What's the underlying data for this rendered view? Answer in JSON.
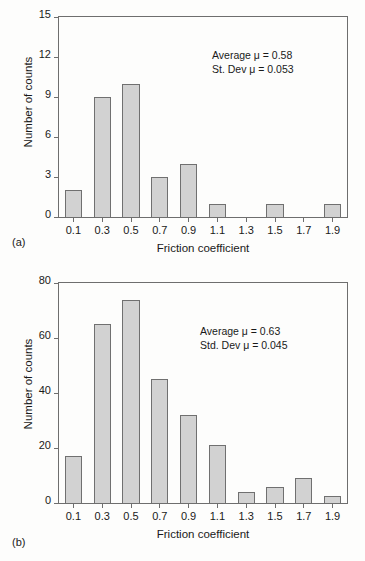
{
  "figure": {
    "panels": [
      {
        "tag": "(a)",
        "annotation_lines": [
          "Average μ = 0.58",
          "St. Dev μ = 0.053"
        ]
      },
      {
        "tag": "(b)",
        "annotation_lines": [
          "Average μ = 0.63",
          "Std. Dev μ = 0.045"
        ]
      }
    ]
  },
  "chart_data": [
    {
      "type": "bar",
      "title": "",
      "xlabel": "Friction coefficient",
      "ylabel": "Number of counts",
      "categories": [
        "0.1",
        "0.3",
        "0.5",
        "0.7",
        "0.9",
        "1.1",
        "1.3",
        "1.5",
        "1.7",
        "1.9"
      ],
      "values": [
        2,
        9,
        10,
        3,
        4,
        1,
        0,
        1,
        0,
        1
      ],
      "ylim": [
        0,
        15
      ],
      "yticks": [
        0,
        3,
        6,
        9,
        12,
        15
      ],
      "xticks": [
        "0.1",
        "0.3",
        "0.5",
        "0.7",
        "0.9",
        "1.1",
        "1.3",
        "1.5",
        "1.7",
        "1.9"
      ],
      "grid": false,
      "legend": "none",
      "annotations": [
        "Average μ = 0.58",
        "St. Dev μ = 0.053"
      ],
      "stats": {
        "average_mu": 0.58,
        "std_dev_mu": 0.053
      },
      "bar_fill": "#d2d2d2",
      "bar_edge": "#707070"
    },
    {
      "type": "bar",
      "title": "",
      "xlabel": "Friction coefficient",
      "ylabel": "Number of counts",
      "categories": [
        "0.1",
        "0.3",
        "0.5",
        "0.7",
        "0.9",
        "1.1",
        "1.3",
        "1.5",
        "1.7",
        "1.9"
      ],
      "values": [
        17,
        65,
        74,
        45,
        32,
        21,
        4,
        6,
        9,
        2.5
      ],
      "ylim": [
        0,
        80
      ],
      "yticks": [
        0,
        20,
        40,
        60,
        80
      ],
      "xticks": [
        "0.1",
        "0.3",
        "0.5",
        "0.7",
        "0.9",
        "1.1",
        "1.3",
        "1.5",
        "1.7",
        "1.9"
      ],
      "grid": false,
      "legend": "none",
      "annotations": [
        "Average μ = 0.63",
        "Std. Dev μ = 0.045"
      ],
      "stats": {
        "average_mu": 0.63,
        "std_dev_mu": 0.045
      },
      "bar_fill": "#d2d2d2",
      "bar_edge": "#707070"
    }
  ]
}
